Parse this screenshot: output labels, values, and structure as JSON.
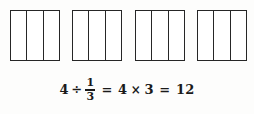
{
  "figure": {
    "kind": "fraction-division-model",
    "shapes": [
      {
        "label": "whole-1",
        "parts": 3,
        "shaded": 0
      },
      {
        "label": "whole-2",
        "parts": 3,
        "shaded": 0
      },
      {
        "label": "whole-3",
        "parts": 3,
        "shaded": 0
      },
      {
        "label": "whole-4",
        "parts": 3,
        "shaded": 0
      }
    ],
    "line_color": "#262626",
    "fill_color": "#ffffff",
    "background_color": "#fdfdfc"
  },
  "equation": {
    "full_text": "4 ÷ 1/3 = 4 × 3 = 12",
    "dividend": "4",
    "divide_symbol": "÷",
    "fraction": {
      "numerator": "1",
      "denominator": "3"
    },
    "equals_1": "=",
    "factor_a": "4",
    "times_symbol": "×",
    "factor_b": "3",
    "equals_2": "=",
    "result": "12",
    "text_color": "#1a1a1a"
  }
}
